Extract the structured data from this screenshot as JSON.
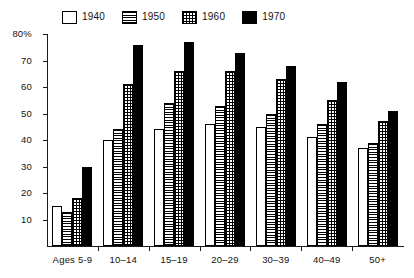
{
  "chart_data": {
    "type": "bar",
    "title": "",
    "subtitle": "",
    "xlabel": "",
    "ylabel": "",
    "ylim": [
      0,
      80
    ],
    "yticks": [
      0,
      10,
      20,
      30,
      40,
      50,
      60,
      70,
      80
    ],
    "ytick_labels": [
      "",
      "10",
      "20",
      "30",
      "40",
      "50",
      "60",
      "70",
      "80%"
    ],
    "grid": false,
    "legend_position": "top-left",
    "categories": [
      "Ages 5-9",
      "10–14",
      "15–19",
      "20–29",
      "30–39",
      "40–49",
      "50+"
    ],
    "series": [
      {
        "name": "1940",
        "pattern": "open",
        "values": [
          15,
          40,
          44,
          46,
          45,
          41,
          37
        ]
      },
      {
        "name": "1950",
        "pattern": "hstripe",
        "values": [
          13,
          44,
          54,
          53,
          50,
          46,
          39
        ]
      },
      {
        "name": "1960",
        "pattern": "dot",
        "values": [
          18,
          61,
          66,
          66,
          63,
          55,
          47
        ]
      },
      {
        "name": "1970",
        "pattern": "solid",
        "values": [
          30,
          76,
          77,
          73,
          68,
          62,
          51
        ]
      }
    ]
  },
  "legend": {
    "items": [
      {
        "label": "1940",
        "pattern": "open"
      },
      {
        "label": "1950",
        "pattern": "hstripe"
      },
      {
        "label": "1960",
        "pattern": "dot"
      },
      {
        "label": "1970",
        "pattern": "solid"
      }
    ]
  }
}
